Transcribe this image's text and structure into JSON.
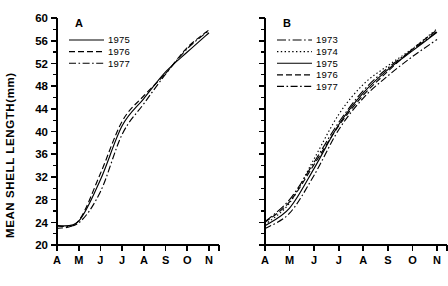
{
  "figure": {
    "y_axis_title": "MEAN SHELL LENGTH(mm)",
    "y_ticks": [
      "20",
      "24",
      "28",
      "32",
      "36",
      "40",
      "44",
      "48",
      "52",
      "56",
      "60"
    ],
    "x_ticks": [
      "A",
      "M",
      "J",
      "J",
      "A",
      "S",
      "O",
      "N"
    ],
    "ink_color": "#000000",
    "background": "#ffffff"
  },
  "panels": [
    {
      "letter": "A",
      "legend": [
        {
          "label": "1975",
          "style": "solid"
        },
        {
          "label": "1976",
          "style": "dashed"
        },
        {
          "label": "1977",
          "style": "dashdot"
        }
      ]
    },
    {
      "letter": "B",
      "legend": [
        {
          "label": "1973",
          "style": "longdashdot"
        },
        {
          "label": "1974",
          "style": "dotted"
        },
        {
          "label": "1975",
          "style": "solid"
        },
        {
          "label": "1976",
          "style": "dashed"
        },
        {
          "label": "1977",
          "style": "dashdot"
        }
      ]
    }
  ],
  "chart_data": [
    {
      "type": "line",
      "title": "A",
      "xlabel": "",
      "ylabel": "MEAN SHELL LENGTH(mm)",
      "ylim": [
        20,
        60
      ],
      "y_major_step": 4,
      "y_minor_step": 2,
      "grid": false,
      "legend_position": "top-left",
      "categories": [
        "A",
        "M",
        "J",
        "J",
        "A",
        "S",
        "O",
        "N"
      ],
      "x": [
        1,
        2,
        3,
        4,
        5,
        6,
        7,
        8
      ],
      "series": [
        {
          "name": "1975",
          "style": "solid",
          "values": [
            23.4,
            24.2,
            31.5,
            41.0,
            45.8,
            50.5,
            54.0,
            57.4
          ]
        },
        {
          "name": "1976",
          "style": "dashed",
          "values": [
            22.9,
            24.3,
            32.6,
            41.8,
            46.3,
            50.2,
            54.8,
            57.9
          ]
        },
        {
          "name": "1977",
          "style": "dashdot",
          "values": [
            23.3,
            23.9,
            29.4,
            39.5,
            44.9,
            50.1,
            54.6,
            57.8
          ]
        }
      ]
    },
    {
      "type": "line",
      "title": "B",
      "xlabel": "",
      "ylabel": "MEAN SHELL LENGTH(mm)",
      "ylim": [
        20,
        60
      ],
      "y_major_step": 4,
      "y_minor_step": 2,
      "grid": false,
      "legend_position": "top-left",
      "categories": [
        "A",
        "M",
        "J",
        "J",
        "A",
        "S",
        "O",
        "N"
      ],
      "x": [
        1,
        2,
        3,
        4,
        5,
        6,
        7,
        8
      ],
      "series": [
        {
          "name": "1973",
          "style": "longdashdot",
          "values": [
            24.1,
            28.0,
            34.6,
            41.6,
            47.2,
            51.2,
            54.4,
            57.6
          ]
        },
        {
          "name": "1974",
          "style": "dotted",
          "values": [
            23.6,
            27.4,
            35.2,
            43.0,
            48.3,
            51.6,
            54.6,
            58.1
          ]
        },
        {
          "name": "1975",
          "style": "solid",
          "values": [
            23.4,
            26.5,
            33.5,
            41.2,
            46.8,
            50.9,
            54.2,
            57.5
          ]
        },
        {
          "name": "1976",
          "style": "dashed",
          "values": [
            24.0,
            27.6,
            34.2,
            41.0,
            46.4,
            50.6,
            54.5,
            57.9
          ]
        },
        {
          "name": "1977",
          "style": "dashdot",
          "values": [
            22.9,
            25.6,
            32.3,
            40.3,
            45.9,
            49.8,
            53.2,
            56.2
          ]
        }
      ]
    }
  ]
}
